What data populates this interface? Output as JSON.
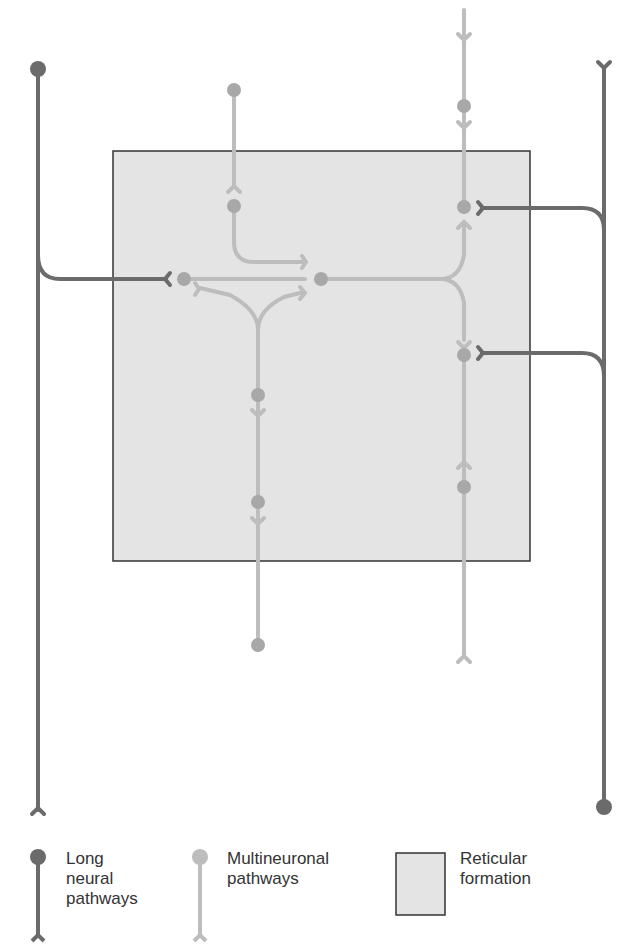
{
  "colors": {
    "long": "#6b6b6b",
    "multi": "#bdbdbd",
    "multi_node": "#a8a8a8",
    "formation_fill": "#e4e4e4",
    "formation_stroke": "#333333"
  },
  "formation": {
    "x": 113,
    "y": 151,
    "w": 417,
    "h": 410
  },
  "legend": {
    "long": "Long\nneural\npathways",
    "multi": "Multineuronal\npathways",
    "formation": "Reticular\nformation"
  }
}
